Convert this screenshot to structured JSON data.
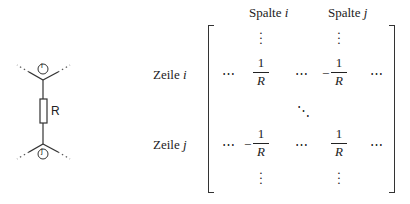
{
  "circuit": {
    "node_top_label": "i",
    "node_bottom_label": "j",
    "resistor_label": "R"
  },
  "matrix": {
    "column_headers": [
      {
        "prefix": "Spalte",
        "var": "i"
      },
      {
        "prefix": "Spalte",
        "var": "j"
      }
    ],
    "row_headers": [
      {
        "prefix": "Zeile",
        "var": "i"
      },
      {
        "prefix": "Zeile",
        "var": "j"
      }
    ],
    "ellipsis_h": "⋯",
    "ellipsis_v": "⋮",
    "ellipsis_d": "⋱",
    "entries": {
      "ii": {
        "sign": "",
        "num": "1",
        "den": "R"
      },
      "ij": {
        "sign": "−",
        "num": "1",
        "den": "R"
      },
      "ji": {
        "sign": "−",
        "num": "1",
        "den": "R"
      },
      "jj": {
        "sign": "",
        "num": "1",
        "den": "R"
      }
    }
  }
}
